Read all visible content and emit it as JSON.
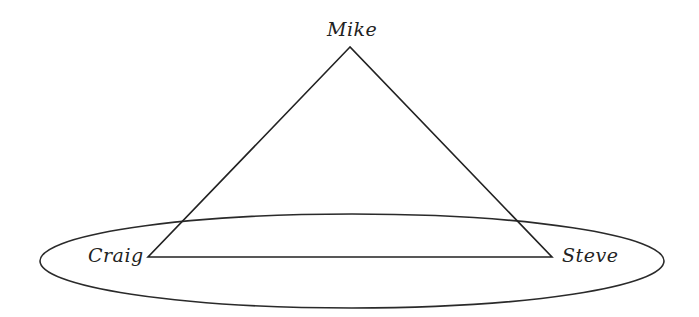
{
  "diagram": {
    "type": "triangle-with-ellipse",
    "stroke_color": "#222222",
    "background": "#ffffff",
    "nodes": [
      {
        "id": "mike",
        "label": "Mike",
        "position": "top"
      },
      {
        "id": "craig",
        "label": "Craig",
        "position": "bottom-left"
      },
      {
        "id": "steve",
        "label": "Steve",
        "position": "bottom-right"
      }
    ],
    "edges": [
      {
        "from": "mike",
        "to": "craig"
      },
      {
        "from": "mike",
        "to": "steve"
      },
      {
        "from": "craig",
        "to": "steve"
      }
    ],
    "grouping": {
      "shape": "ellipse",
      "encloses": [
        "craig",
        "steve"
      ]
    }
  }
}
